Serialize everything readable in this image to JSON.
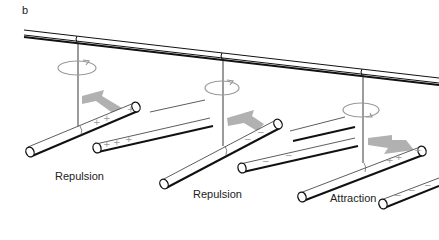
{
  "figure": {
    "panel_label": "b",
    "colors": {
      "line": "#111111",
      "arrow": "#a8a8a8",
      "rotation": "#9a9a9a",
      "sign": "#9a9a9a",
      "background": "#ffffff"
    },
    "scenes": [
      {
        "caption": "Repulsion",
        "suspended_rod_charge": "+",
        "fixed_rod_charge": "+",
        "force_direction": "away",
        "rotation_icon": "rotation-arrow-icon"
      },
      {
        "caption": "Repulsion",
        "suspended_rod_charge": "-",
        "fixed_rod_charge": "-",
        "force_direction": "away",
        "rotation_icon": "rotation-arrow-icon"
      },
      {
        "caption": "Attraction",
        "suspended_rod_charge": "+",
        "fixed_rod_charge": "-",
        "force_direction": "toward",
        "rotation_icon": "rotation-arrow-icon"
      }
    ],
    "signs": {
      "plus": "+",
      "minus": "−"
    }
  }
}
